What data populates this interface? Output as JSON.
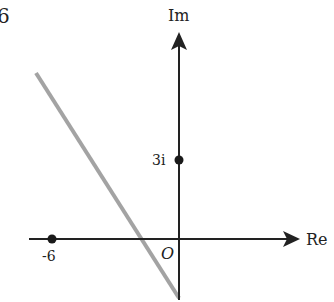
{
  "figure": {
    "number_label": "6",
    "axes": {
      "x_label": "Re",
      "y_label": "Im",
      "origin_label": "O"
    },
    "points": [
      {
        "label": "-6",
        "re": -6,
        "im": 0
      },
      {
        "label": "3i",
        "re": 0,
        "im": 3
      }
    ],
    "line": {
      "description": "perpendicular bisector of -6 and 3i",
      "color": "#a0a0a0"
    },
    "colors": {
      "axis": "#222222",
      "line": "#a0a0a0",
      "point": "#1a1a1a"
    }
  }
}
